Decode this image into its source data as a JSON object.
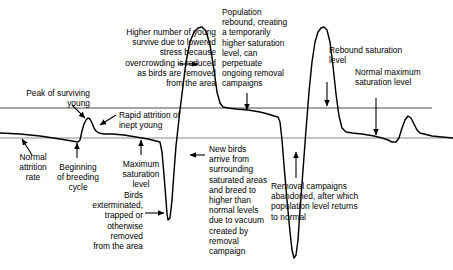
{
  "figure": {
    "width": 453,
    "height": 270,
    "background": "#ffffff",
    "curve_color": "#000000",
    "reference_line_color": "#808080",
    "arrow_color": "#000000"
  },
  "reference_lines": [
    {
      "name": "rebound-saturation-level",
      "y": 108,
      "color": "#4d4d4d",
      "x1": 0,
      "x2": 432
    },
    {
      "name": "normal-maximum-saturation-level",
      "y": 138,
      "color": "#8c8c8c",
      "x1": 0,
      "x2": 453
    }
  ],
  "labels": {
    "higher_number_young": "Higher number of young\nsurvive due to lowered\nstress because\novercrowding is reduced\nas birds are removed\nfrom the area",
    "population_rebound": "Population\nrebound, creating\na temporarily\nhigher saturation\nlevel, can\nperpetuate\nongoing removal\ncampaigns",
    "rebound_saturation_level": "Rebound saturation\nlevel",
    "normal_maximum_saturation_level": "Normal maximum\nsaturation level",
    "peak_of_surviving_young": "Peak of surviving\nyoung",
    "rapid_attrition": "Rapid attrition of\ninept young",
    "normal_attrition_rate": "Normal\nattrition\nrate",
    "beginning_of_breeding_cycle": "Beginning\nof breeding\ncycle",
    "maximum_saturation_level": "Maximum\nsaturation\nlevel",
    "birds_exterminated": "Birds\nexterminated,\ntrapped or\notherwise\nremoved\nfrom the area",
    "new_birds_arrive": "New birds\narrive from\nsurrounding\nsaturated areas\nand breed to\nhigher than\nnormal levels\ndue to vacuum\ncreated by removal\ncampaign",
    "removal_campaigns_abandoned": "Removal campaigns\nabandoned, after which\npopulation level returns\nto normal"
  },
  "chart_data": {
    "type": "line",
    "xlabel": "Time",
    "ylabel": "Population level",
    "grid": false,
    "legend": "none",
    "reference_levels": [
      {
        "label": "Rebound saturation level",
        "value": 108
      },
      {
        "label": "Normal maximum saturation level",
        "value": 138
      }
    ],
    "annotations": [
      "Peak of surviving young",
      "Rapid attrition of inept young",
      "Normal attrition rate",
      "Beginning of breeding cycle",
      "Maximum saturation level",
      "Birds exterminated, trapped or otherwise removed from the area",
      "Higher number of young survive due to lowered stress because overcrowding is reduced as birds are removed from the area",
      "New birds arrive from surrounding saturated areas and breed to higher than normal levels due to vacuum created by removal campaign",
      "Population rebound, creating a temporarily higher saturation level, can perpetuate ongoing removal campaigns",
      "Rebound saturation level",
      "Normal maximum saturation level",
      "Removal campaigns abandoned, after which population level returns to normal"
    ],
    "series": [
      {
        "name": "population-level",
        "points": [
          [
            0,
            133
          ],
          [
            20,
            134
          ],
          [
            40,
            136
          ],
          [
            60,
            139
          ],
          [
            72,
            141
          ],
          [
            78,
            142
          ],
          [
            80,
            140
          ],
          [
            82,
            131
          ],
          [
            84,
            124
          ],
          [
            86,
            120
          ],
          [
            88,
            118
          ],
          [
            90,
            119
          ],
          [
            92,
            123
          ],
          [
            94,
            128
          ],
          [
            96,
            131
          ],
          [
            99,
            133
          ],
          [
            104,
            134
          ],
          [
            112,
            134
          ],
          [
            124,
            135
          ],
          [
            136,
            137
          ],
          [
            148,
            139
          ],
          [
            156,
            141
          ],
          [
            160,
            142
          ],
          [
            162,
            152
          ],
          [
            164,
            175
          ],
          [
            166,
            200
          ],
          [
            167,
            214
          ],
          [
            168,
            220
          ],
          [
            170,
            218
          ],
          [
            172,
            200
          ],
          [
            174,
            172
          ],
          [
            176,
            146
          ],
          [
            178,
            128
          ],
          [
            180,
            110
          ],
          [
            183,
            86
          ],
          [
            186,
            62
          ],
          [
            190,
            42
          ],
          [
            194,
            32
          ],
          [
            198,
            28
          ],
          [
            202,
            27
          ],
          [
            206,
            31
          ],
          [
            210,
            45
          ],
          [
            214,
            70
          ],
          [
            217,
            92
          ],
          [
            220,
            103
          ],
          [
            223,
            107
          ],
          [
            228,
            108
          ],
          [
            236,
            109
          ],
          [
            248,
            110
          ],
          [
            260,
            112
          ],
          [
            268,
            114
          ],
          [
            274,
            116
          ],
          [
            278,
            117
          ],
          [
            280,
            122
          ],
          [
            282,
            140
          ],
          [
            284,
            165
          ],
          [
            287,
            200
          ],
          [
            290,
            232
          ],
          [
            292,
            250
          ],
          [
            294,
            258
          ],
          [
            296,
            255
          ],
          [
            298,
            240
          ],
          [
            300,
            210
          ],
          [
            303,
            170
          ],
          [
            306,
            130
          ],
          [
            309,
            92
          ],
          [
            312,
            62
          ],
          [
            315,
            42
          ],
          [
            318,
            32
          ],
          [
            321,
            28
          ],
          [
            324,
            27
          ],
          [
            327,
            30
          ],
          [
            330,
            42
          ],
          [
            333,
            66
          ],
          [
            336,
            94
          ],
          [
            339,
            116
          ],
          [
            342,
            128
          ],
          [
            346,
            132
          ],
          [
            352,
            133
          ],
          [
            362,
            134
          ],
          [
            374,
            136
          ],
          [
            382,
            138
          ],
          [
            388,
            140
          ],
          [
            392,
            142
          ],
          [
            396,
            142
          ],
          [
            399,
            138
          ],
          [
            402,
            128
          ],
          [
            405,
            120
          ],
          [
            408,
            116
          ],
          [
            411,
            118
          ],
          [
            414,
            124
          ],
          [
            417,
            130
          ],
          [
            420,
            133
          ],
          [
            424,
            134
          ],
          [
            432,
            136
          ],
          [
            442,
            137
          ],
          [
            453,
            138
          ]
        ]
      }
    ]
  },
  "arrows": [
    {
      "name": "arrow-peak-of-surviving-young",
      "x1": 72,
      "y1": 105,
      "x2": 85,
      "y2": 118
    },
    {
      "name": "arrow-higher-number-young",
      "x1": 178,
      "y1": 64,
      "x2": 198,
      "y2": 64
    },
    {
      "name": "arrow-rapid-attrition",
      "x1": 116,
      "y1": 115,
      "x2": 100,
      "y2": 125
    },
    {
      "name": "arrow-population-rebound",
      "x1": 247,
      "y1": 93,
      "x2": 247,
      "y2": 110
    },
    {
      "name": "arrow-rebound-saturation-level",
      "x1": 327,
      "y1": 82,
      "x2": 327,
      "y2": 106
    },
    {
      "name": "arrow-normal-maximum-saturation",
      "x1": 376,
      "y1": 98,
      "x2": 376,
      "y2": 135
    },
    {
      "name": "arrow-normal-attrition-rate",
      "x1": 32,
      "y1": 155,
      "x2": 22,
      "y2": 139
    },
    {
      "name": "arrow-beginning-breeding-cycle",
      "x1": 77,
      "y1": 158,
      "x2": 77,
      "y2": 143
    },
    {
      "name": "arrow-maximum-saturation-level",
      "x1": 141,
      "y1": 155,
      "x2": 141,
      "y2": 140
    },
    {
      "name": "arrow-birds-exterminated",
      "x1": 145,
      "y1": 213,
      "x2": 164,
      "y2": 213
    },
    {
      "name": "arrow-new-birds-arrive",
      "x1": 205,
      "y1": 155,
      "x2": 190,
      "y2": 155
    },
    {
      "name": "arrow-removal-campaigns-abandoned",
      "x1": 296,
      "y1": 178,
      "x2": 296,
      "y2": 152
    }
  ]
}
